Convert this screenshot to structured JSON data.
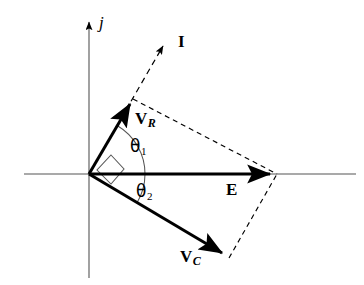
{
  "figure": {
    "type": "phasor-diagram",
    "background_color": "#ffffff",
    "stroke_color": "#000000",
    "axis_color": "#555555",
    "width": 364,
    "height": 285
  },
  "axes": {
    "origin": {
      "x": 89,
      "y": 174
    },
    "horizontal": {
      "x1": 24,
      "y1": 174,
      "x2": 356,
      "y2": 174,
      "label": ""
    },
    "vertical": {
      "x1": 89,
      "y1": 278,
      "x2": 89,
      "y2": 17,
      "label": "j",
      "arrow": "up"
    },
    "imaginary_axis_label": "j"
  },
  "vectors": [
    {
      "name": "I",
      "label": "I",
      "label_sub": "",
      "style": "dashed",
      "from": {
        "x": 89,
        "y": 174
      },
      "to": {
        "x": 166,
        "y": 41
      },
      "label_pos": {
        "x": 178,
        "y": 33
      },
      "arrow": true
    },
    {
      "name": "VR",
      "label": "V",
      "label_sub": "R",
      "style": "solid",
      "from": {
        "x": 89,
        "y": 174
      },
      "to": {
        "x": 133,
        "y": 99
      },
      "label_pos": {
        "x": 135,
        "y": 110
      },
      "arrow": true
    },
    {
      "name": "E",
      "label": "E",
      "label_sub": "",
      "style": "solid",
      "from": {
        "x": 89,
        "y": 174
      },
      "to": {
        "x": 277,
        "y": 174
      },
      "label_pos": {
        "x": 226,
        "y": 181
      },
      "arrow": true
    },
    {
      "name": "VC",
      "label": "V",
      "label_sub": "C",
      "style": "solid",
      "from": {
        "x": 89,
        "y": 174
      },
      "to": {
        "x": 229,
        "y": 258
      },
      "label_pos": {
        "x": 180,
        "y": 248
      },
      "arrow": true
    }
  ],
  "construction_lines": [
    {
      "name": "vr-to-e-dashed",
      "style": "dashed",
      "from": {
        "x": 133,
        "y": 99
      },
      "to": {
        "x": 277,
        "y": 174
      }
    },
    {
      "name": "vc-to-e-dashed",
      "style": "dashed",
      "from": {
        "x": 229,
        "y": 258
      },
      "to": {
        "x": 277,
        "y": 174
      }
    }
  ],
  "angles": [
    {
      "name": "theta1",
      "label": "θ",
      "label_sub": "1",
      "label_pos": {
        "x": 130,
        "y": 138
      },
      "between": [
        "VR",
        "E"
      ],
      "arc_radius": 56,
      "start_deg": 0,
      "end_deg": 59.6
    },
    {
      "name": "theta2",
      "label": "θ",
      "label_sub": "2",
      "label_pos": {
        "x": 136,
        "y": 183
      },
      "between": [
        "E",
        "VC"
      ],
      "arc_radius": 56,
      "start_deg": 0,
      "end_deg": -31.0
    }
  ],
  "right_angle_marker": {
    "name": "right-angle-vr-vc",
    "description": "square marker indicating 90 degrees between VR and VC",
    "points": "111,155 124,169 111,184 97,170"
  }
}
